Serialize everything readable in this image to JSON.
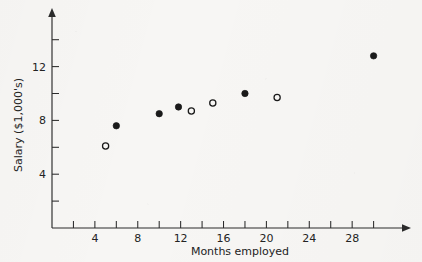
{
  "chart_data": {
    "type": "scatter",
    "title": "",
    "xlabel": "Months employed",
    "ylabel": "Salary ($1,000's)",
    "xlim": [
      0,
      31.5
    ],
    "ylim": [
      0,
      14.6
    ],
    "grid": false,
    "legend": "none",
    "x_ticks_major": [
      4,
      8,
      12,
      16,
      20,
      24,
      28
    ],
    "x_ticks_minor": [
      2,
      6,
      10,
      14,
      18,
      22,
      26,
      30
    ],
    "x_tick_labels": [
      "4",
      "8",
      "12",
      "16",
      "20",
      "24",
      "28"
    ],
    "y_ticks_major": [
      4,
      8,
      12
    ],
    "y_ticks_minor": [
      2,
      6,
      10,
      14
    ],
    "y_tick_labels": [
      "4",
      "8",
      "12"
    ],
    "series": [
      {
        "name": "filled",
        "marker": "filled-circle",
        "points": [
          {
            "x": 6,
            "y": 7.6
          },
          {
            "x": 10,
            "y": 8.5
          },
          {
            "x": 11.8,
            "y": 9.0
          },
          {
            "x": 18,
            "y": 10.0
          },
          {
            "x": 30,
            "y": 12.8
          }
        ]
      },
      {
        "name": "open",
        "marker": "open-circle",
        "points": [
          {
            "x": 5,
            "y": 6.1
          },
          {
            "x": 13,
            "y": 8.7
          },
          {
            "x": 15,
            "y": 9.3
          },
          {
            "x": 21,
            "y": 9.7
          }
        ]
      }
    ]
  },
  "axes": {
    "x_axis_label": "Months employed",
    "y_axis_label": "Salary ($1,000's)"
  }
}
